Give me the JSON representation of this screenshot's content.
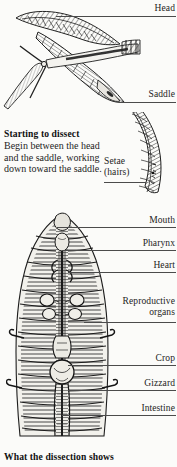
{
  "page": {
    "background_color": "#fbfbf9",
    "ink_color": "#232323",
    "leader_color": "#4b4b4b"
  },
  "figures": [
    {
      "id": "cutting-figure",
      "name": "earthworm-being-cut-with-scissors",
      "alt": "Scissors cutting open an earthworm between the head and the saddle"
    },
    {
      "id": "setae-figure",
      "name": "earthworm-segment-setae-closeup",
      "alt": "Close-up of a curved earthworm body showing setae hairs"
    },
    {
      "id": "dissection-figure",
      "name": "dissected-earthworm-internal-anatomy",
      "alt": "Pinned open earthworm showing internal organs"
    }
  ],
  "labels": {
    "head": "Head",
    "saddle": "Saddle",
    "setae_line1": "Setae",
    "setae_line2": "(hairs)",
    "mouth": "Mouth",
    "pharynx": "Pharynx",
    "heart": "Heart",
    "reproductive_line1": "Reproductive",
    "reproductive_line2": "organs",
    "crop": "Crop",
    "gizzard": "Gizzard",
    "intestine": "Intestine"
  },
  "captions": {
    "starting_heading": "Starting to dissect",
    "starting_body": "Begin between the head and the saddle, working down toward the saddle.",
    "dissection_heading": "What the dissection shows"
  }
}
